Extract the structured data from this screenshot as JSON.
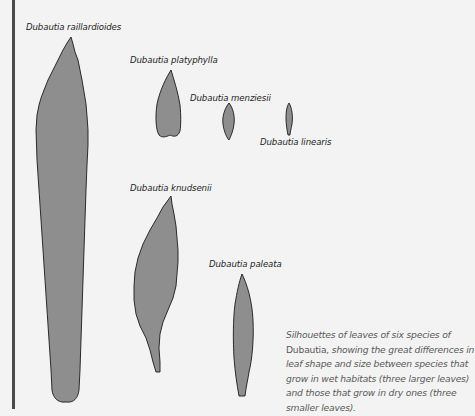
{
  "species": [
    {
      "id": "raillardioides",
      "label": "Dubautia raillardioides",
      "habitat": "wet",
      "size": "large"
    },
    {
      "id": "platyphylla",
      "label": "Dubautia platyphylla",
      "habitat": "dry",
      "size": "small"
    },
    {
      "id": "menziesii",
      "label": "Dubautia menziesii",
      "habitat": "dry",
      "size": "small"
    },
    {
      "id": "linearis",
      "label": "Dubautia linearis",
      "habitat": "dry",
      "size": "small"
    },
    {
      "id": "knudsenii",
      "label": "Dubautia knudsenii",
      "habitat": "wet",
      "size": "large"
    },
    {
      "id": "paleata",
      "label": "Dubautia paleata",
      "habitat": "wet",
      "size": "large"
    }
  ],
  "caption": {
    "part1": "Silhouettes of leaves of six species of ",
    "genus": "Dubautia",
    "part2": ", showing the great differences in leaf shape and size between species that grow in wet habitats (three larger leaves) and those that grow in dry ones (three smaller leaves)."
  },
  "colors": {
    "background": "#f3f3f3",
    "leaf_fill": "#8e8e8e",
    "leaf_outline": "#1a1a1a",
    "rule": "#4a4a4a",
    "caption_text": "#5a5a5a"
  }
}
